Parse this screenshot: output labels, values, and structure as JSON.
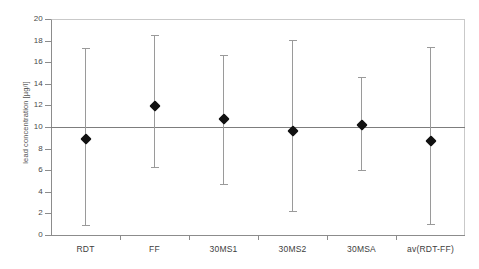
{
  "chart_data": {
    "type": "scatter",
    "title": "",
    "xlabel": "",
    "ylabel": "lead concentration [µg/l]",
    "ylim": [
      0,
      20
    ],
    "ytick_step": 2,
    "yticks": [
      0,
      2,
      4,
      6,
      8,
      10,
      12,
      14,
      16,
      18,
      20
    ],
    "ytick_labels": [
      "0",
      "2",
      "4",
      "6",
      "8",
      "10",
      "12",
      "14",
      "16",
      "18",
      "20"
    ],
    "grid": false,
    "legend": "none",
    "reference_line": {
      "value": 10,
      "label": "",
      "color": "#7d7d7d"
    },
    "marker_color": "#111111",
    "errorbar_color": "#9a9a9a",
    "axis_color": "#8c8c8c",
    "categories": [
      "RDT",
      "FF",
      "30MS1",
      "30MS2",
      "30MSA",
      "av(RDT-FF)"
    ],
    "values": [
      8.9,
      11.9,
      10.7,
      9.6,
      10.2,
      8.7
    ],
    "error_low": [
      0.9,
      6.3,
      4.7,
      2.2,
      6.0,
      1.0
    ],
    "error_high": [
      17.3,
      18.5,
      16.7,
      18.1,
      14.6,
      17.4
    ],
    "points": [
      {
        "category": "RDT",
        "value": 8.9,
        "low": 0.9,
        "high": 17.3
      },
      {
        "category": "FF",
        "value": 11.9,
        "low": 6.3,
        "high": 18.5
      },
      {
        "category": "30MS1",
        "value": 10.7,
        "low": 4.7,
        "high": 16.7
      },
      {
        "category": "30MS2",
        "value": 9.6,
        "low": 2.2,
        "high": 18.1
      },
      {
        "category": "30MSA",
        "value": 10.2,
        "low": 6.0,
        "high": 14.6
      },
      {
        "category": "av(RDT-FF)",
        "value": 8.7,
        "low": 1.0,
        "high": 17.4
      }
    ]
  }
}
